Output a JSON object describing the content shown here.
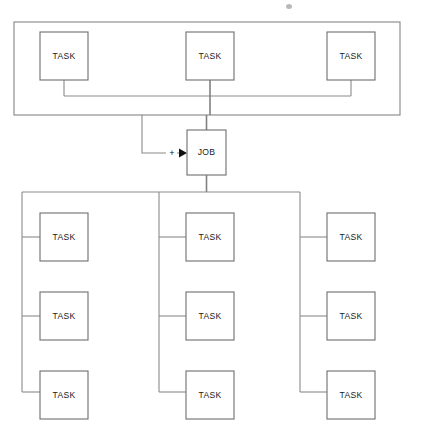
{
  "diagram": {
    "colors": {
      "background": "#ffffff",
      "node_stroke": "#6e6e6e",
      "frame_stroke": "#868686",
      "connector": "#8a8a8a",
      "text": "#1a1a1a",
      "arrow": "#111111"
    },
    "canvas": {
      "width": 424,
      "height": 442
    }
  },
  "labels": {
    "task": "TASK",
    "job": "JOB",
    "plus": "+"
  },
  "input_group": {
    "name": "input-task-group",
    "frame": {
      "x": 14,
      "y": 22,
      "width": 386,
      "height": 93
    },
    "tasks": [
      {
        "id": "input-task-1",
        "label": "TASK",
        "x": 40,
        "y": 32,
        "width": 48,
        "height": 48
      },
      {
        "id": "input-task-2",
        "label": "TASK",
        "x": 186,
        "y": 32,
        "width": 48,
        "height": 48
      },
      {
        "id": "input-task-3",
        "label": "TASK",
        "x": 327,
        "y": 32,
        "width": 48,
        "height": 48
      }
    ],
    "bus_y": 96
  },
  "job_node": {
    "id": "job-node",
    "label": "JOB",
    "x": 187,
    "y": 130,
    "width": 39,
    "height": 45
  },
  "aggregator": {
    "id": "plus-operator",
    "label": "+",
    "x": 172,
    "y": 153,
    "arrow_tip_x": 187,
    "arrow_y": 153,
    "feed_x": 142
  },
  "output_group": {
    "name": "output-task-group",
    "columns": [
      {
        "id": "output-column-left",
        "rail_x": 22,
        "rail_top": 192,
        "rail_bottom": 392,
        "tasks": [
          {
            "id": "output-task-l1",
            "label": "TASK",
            "x": 40,
            "y": 213,
            "width": 48,
            "height": 48
          },
          {
            "id": "output-task-l2",
            "label": "TASK",
            "x": 40,
            "y": 292,
            "width": 48,
            "height": 48
          },
          {
            "id": "output-task-l3",
            "label": "TASK",
            "x": 40,
            "y": 371,
            "width": 48,
            "height": 48
          }
        ]
      },
      {
        "id": "output-column-middle",
        "rail_x": 159,
        "rail_top": 192,
        "rail_bottom": 392,
        "tasks": [
          {
            "id": "output-task-m1",
            "label": "TASK",
            "x": 186,
            "y": 213,
            "width": 48,
            "height": 48
          },
          {
            "id": "output-task-m2",
            "label": "TASK",
            "x": 186,
            "y": 292,
            "width": 48,
            "height": 48
          },
          {
            "id": "output-task-m3",
            "label": "TASK",
            "x": 186,
            "y": 371,
            "width": 48,
            "height": 48
          }
        ]
      },
      {
        "id": "output-column-right",
        "rail_x": 300,
        "rail_top": 192,
        "rail_bottom": 392,
        "tasks": [
          {
            "id": "output-task-r1",
            "label": "TASK",
            "x": 327,
            "y": 213,
            "width": 48,
            "height": 48
          },
          {
            "id": "output-task-r2",
            "label": "TASK",
            "x": 327,
            "y": 292,
            "width": 48,
            "height": 48
          },
          {
            "id": "output-task-r3",
            "label": "TASK",
            "x": 327,
            "y": 371,
            "width": 48,
            "height": 48
          }
        ]
      }
    ],
    "header_y": 192,
    "header_x_start": 22,
    "header_x_end": 300
  },
  "artifact": {
    "id": "scan-speck",
    "x": 286,
    "y": 4,
    "width": 6,
    "height": 5
  }
}
